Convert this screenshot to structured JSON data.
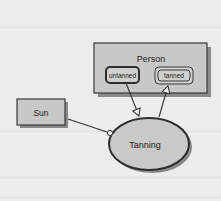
{
  "diagram": {
    "type": "OPM object-process diagram",
    "objects": [
      {
        "id": "person",
        "label": "Person",
        "states": [
          {
            "id": "untanned",
            "label": "untanned"
          },
          {
            "id": "tanned",
            "label": "tanned"
          }
        ]
      },
      {
        "id": "sun",
        "label": "Sun"
      }
    ],
    "processes": [
      {
        "id": "tanning",
        "label": "Tanning"
      }
    ],
    "links": [
      {
        "from": "untanned",
        "to": "tanning",
        "kind": "consumption",
        "end": "arrow"
      },
      {
        "from": "tanning",
        "to": "tanned",
        "kind": "result",
        "end": "arrow"
      },
      {
        "from": "sun",
        "to": "tanning",
        "kind": "instrument",
        "end": "hollow-circle"
      }
    ]
  },
  "colors": {
    "background": "#ededea",
    "object_fill": "#c8c8c6",
    "process_fill": "#c9c9c7",
    "border": "#3a3a3a",
    "shadow": "#8a8a88"
  }
}
